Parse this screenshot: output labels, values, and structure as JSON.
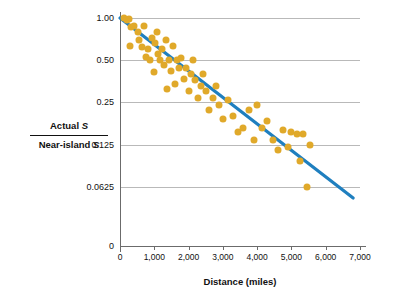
{
  "chart_data": {
    "type": "scatter",
    "title": "",
    "xlabel": "Distance (miles)",
    "ylabel_numerator": "Actual S",
    "ylabel_denominator": "Near-island S",
    "xlim": [
      0,
      7000
    ],
    "ylim_log": [
      0.04,
      1.0
    ],
    "xticks": [
      0,
      1000,
      2000,
      3000,
      4000,
      5000,
      6000,
      7000
    ],
    "xtick_labels": [
      "0",
      "1,000",
      "2,000",
      "3,000",
      "4,000",
      "5,000",
      "6,000",
      "7,000"
    ],
    "yticks": [
      0.0625,
      0.125,
      0.25,
      0.5,
      1.0
    ],
    "ytick_labels": [
      "0.0625",
      "0.125",
      "0.25",
      "0.50",
      "1.00"
    ],
    "y_zero_label": "0",
    "grid": "horizontal",
    "legend": "none",
    "point_color": "#e0a92a",
    "line_color": "#1f7fbf",
    "axis_color": "#6b6b6b",
    "trend_line": {
      "x0": 0,
      "y0": 1.0,
      "x1": 6800,
      "y1": 0.052
    },
    "points": [
      {
        "x": 120,
        "y": 1.0
      },
      {
        "x": 190,
        "y": 0.96
      },
      {
        "x": 260,
        "y": 0.99
      },
      {
        "x": 330,
        "y": 0.86
      },
      {
        "x": 300,
        "y": 0.63
      },
      {
        "x": 420,
        "y": 0.88
      },
      {
        "x": 520,
        "y": 0.8
      },
      {
        "x": 560,
        "y": 0.7
      },
      {
        "x": 640,
        "y": 0.62
      },
      {
        "x": 700,
        "y": 0.88
      },
      {
        "x": 760,
        "y": 0.53
      },
      {
        "x": 820,
        "y": 0.6
      },
      {
        "x": 880,
        "y": 0.5
      },
      {
        "x": 930,
        "y": 0.72
      },
      {
        "x": 980,
        "y": 0.41
      },
      {
        "x": 1020,
        "y": 0.66
      },
      {
        "x": 1080,
        "y": 0.8
      },
      {
        "x": 1120,
        "y": 0.55
      },
      {
        "x": 1180,
        "y": 0.5
      },
      {
        "x": 1230,
        "y": 0.6
      },
      {
        "x": 1290,
        "y": 0.46
      },
      {
        "x": 1340,
        "y": 0.7
      },
      {
        "x": 1360,
        "y": 0.31
      },
      {
        "x": 1430,
        "y": 0.5
      },
      {
        "x": 1480,
        "y": 0.42
      },
      {
        "x": 1540,
        "y": 0.63
      },
      {
        "x": 1600,
        "y": 0.34
      },
      {
        "x": 1660,
        "y": 0.5
      },
      {
        "x": 1720,
        "y": 0.44
      },
      {
        "x": 1790,
        "y": 0.52
      },
      {
        "x": 1860,
        "y": 0.37
      },
      {
        "x": 1930,
        "y": 0.44
      },
      {
        "x": 2000,
        "y": 0.3
      },
      {
        "x": 2060,
        "y": 0.4
      },
      {
        "x": 2130,
        "y": 0.5
      },
      {
        "x": 2200,
        "y": 0.36
      },
      {
        "x": 2270,
        "y": 0.27
      },
      {
        "x": 2350,
        "y": 0.33
      },
      {
        "x": 2420,
        "y": 0.4
      },
      {
        "x": 2500,
        "y": 0.3
      },
      {
        "x": 2600,
        "y": 0.22
      },
      {
        "x": 2700,
        "y": 0.27
      },
      {
        "x": 2800,
        "y": 0.33
      },
      {
        "x": 2900,
        "y": 0.24
      },
      {
        "x": 3000,
        "y": 0.19
      },
      {
        "x": 3150,
        "y": 0.26
      },
      {
        "x": 3300,
        "y": 0.2
      },
      {
        "x": 3450,
        "y": 0.155
      },
      {
        "x": 3600,
        "y": 0.165
      },
      {
        "x": 3750,
        "y": 0.22
      },
      {
        "x": 3900,
        "y": 0.135
      },
      {
        "x": 4000,
        "y": 0.24
      },
      {
        "x": 4150,
        "y": 0.165
      },
      {
        "x": 4300,
        "y": 0.185
      },
      {
        "x": 4450,
        "y": 0.135
      },
      {
        "x": 4600,
        "y": 0.115
      },
      {
        "x": 4750,
        "y": 0.16
      },
      {
        "x": 4900,
        "y": 0.12
      },
      {
        "x": 5000,
        "y": 0.155
      },
      {
        "x": 5150,
        "y": 0.15
      },
      {
        "x": 5250,
        "y": 0.095
      },
      {
        "x": 5350,
        "y": 0.15
      },
      {
        "x": 5450,
        "y": 0.062
      },
      {
        "x": 5550,
        "y": 0.125
      }
    ]
  },
  "axis": {
    "xlabel": "Distance (miles)",
    "ylabel_numerator": "Actual S",
    "ylabel_denominator": "Near-island S"
  }
}
